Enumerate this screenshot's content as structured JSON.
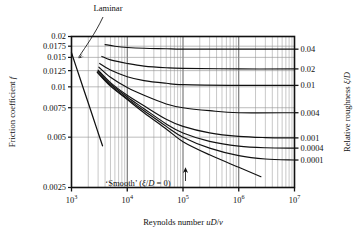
{
  "chart_data": {
    "type": "line",
    "title": "",
    "xlabel": "Reynolds number uD/ν",
    "ylabel": "Friction coefficient f",
    "ylabel_right": "Relative roughness ξ/D",
    "xscale": "log",
    "yscale": "log",
    "xlim": [
      1000,
      10000000
    ],
    "ylim": [
      0.0025,
      0.02
    ],
    "grid": true,
    "legend": "none",
    "xticks": [
      {
        "value": 1000,
        "label": "10³",
        "base": "10",
        "exp": "3"
      },
      {
        "value": 10000,
        "label": "10⁴",
        "base": "10",
        "exp": "4"
      },
      {
        "value": 100000,
        "label": "10⁵",
        "base": "10",
        "exp": "5"
      },
      {
        "value": 1000000,
        "label": "10⁶",
        "base": "10",
        "exp": "6"
      },
      {
        "value": 10000000,
        "label": "10⁷",
        "base": "10",
        "exp": "7"
      }
    ],
    "yticks": [
      {
        "value": 0.02,
        "label": "0.02"
      },
      {
        "value": 0.0175,
        "label": "0.0175"
      },
      {
        "value": 0.015,
        "label": "0.015"
      },
      {
        "value": 0.0125,
        "label": "0.0125"
      },
      {
        "value": 0.01,
        "label": "0.01"
      },
      {
        "value": 0.0075,
        "label": "0.0075"
      },
      {
        "value": 0.005,
        "label": "0.005"
      },
      {
        "value": 0.0025,
        "label": "0.0025"
      }
    ],
    "yticks_right": [
      {
        "value": 0.04,
        "label": "0.04",
        "f_asymptote": 0.0168
      },
      {
        "value": 0.02,
        "label": "0.02",
        "f_asymptote": 0.0128
      },
      {
        "value": 0.01,
        "label": "0.01",
        "f_asymptote": 0.0102
      },
      {
        "value": 0.004,
        "label": "0.004",
        "f_asymptote": 0.007
      },
      {
        "value": 0.001,
        "label": "0.001",
        "f_asymptote": 0.00495
      },
      {
        "value": 0.0004,
        "label": "0.0004",
        "f_asymptote": 0.0043
      },
      {
        "value": 0.0001,
        "label": "0.0001",
        "f_asymptote": 0.00365
      }
    ],
    "series": [
      {
        "name": "xi/D = 0.04",
        "roughness": 0.04,
        "points": [
          [
            4000,
            0.0179
          ],
          [
            6000,
            0.0175
          ],
          [
            10000,
            0.0172
          ],
          [
            20000,
            0.017
          ],
          [
            50000,
            0.0169
          ],
          [
            100000,
            0.0168
          ],
          [
            1000000,
            0.0168
          ],
          [
            10000000,
            0.0168
          ]
        ]
      },
      {
        "name": "xi/D = 0.02",
        "roughness": 0.02,
        "points": [
          [
            3500,
            0.0152
          ],
          [
            5000,
            0.0145
          ],
          [
            10000,
            0.0138
          ],
          [
            20000,
            0.0133
          ],
          [
            50000,
            0.013
          ],
          [
            100000,
            0.0129
          ],
          [
            1000000,
            0.0128
          ],
          [
            10000000,
            0.0128
          ]
        ]
      },
      {
        "name": "xi/D = 0.01",
        "roughness": 0.01,
        "points": [
          [
            3200,
            0.0138
          ],
          [
            5000,
            0.0126
          ],
          [
            10000,
            0.0115
          ],
          [
            20000,
            0.0109
          ],
          [
            50000,
            0.0105
          ],
          [
            100000,
            0.0103
          ],
          [
            1000000,
            0.0102
          ],
          [
            10000000,
            0.0102
          ]
        ]
      },
      {
        "name": "xi/D = 0.004",
        "roughness": 0.004,
        "points": [
          [
            3100,
            0.0131
          ],
          [
            5000,
            0.0114
          ],
          [
            10000,
            0.0099
          ],
          [
            20000,
            0.0089
          ],
          [
            50000,
            0.0079
          ],
          [
            100000,
            0.0075
          ],
          [
            300000,
            0.0072
          ],
          [
            1000000,
            0.007
          ],
          [
            10000000,
            0.007
          ]
        ]
      },
      {
        "name": "xi/D = 0.001",
        "roughness": 0.001,
        "points": [
          [
            3000,
            0.0126
          ],
          [
            5000,
            0.0106
          ],
          [
            10000,
            0.0089
          ],
          [
            20000,
            0.0077
          ],
          [
            50000,
            0.0064
          ],
          [
            100000,
            0.0058
          ],
          [
            300000,
            0.0053
          ],
          [
            1000000,
            0.00505
          ],
          [
            3000000,
            0.00497
          ],
          [
            10000000,
            0.00495
          ]
        ]
      },
      {
        "name": "xi/D = 0.0004",
        "roughness": 0.0004,
        "points": [
          [
            3000,
            0.0124
          ],
          [
            5000,
            0.0104
          ],
          [
            10000,
            0.0087
          ],
          [
            20000,
            0.0074
          ],
          [
            50000,
            0.006
          ],
          [
            100000,
            0.0053
          ],
          [
            300000,
            0.00472
          ],
          [
            1000000,
            0.00442
          ],
          [
            3000000,
            0.00432
          ],
          [
            10000000,
            0.0043
          ]
        ]
      },
      {
        "name": "xi/D = 0.0001",
        "roughness": 0.0001,
        "points": [
          [
            2900,
            0.0123
          ],
          [
            5000,
            0.0102
          ],
          [
            10000,
            0.0085
          ],
          [
            20000,
            0.0072
          ],
          [
            50000,
            0.0058
          ],
          [
            100000,
            0.005
          ],
          [
            300000,
            0.0043
          ],
          [
            1000000,
            0.00388
          ],
          [
            3000000,
            0.0037
          ],
          [
            10000000,
            0.00365
          ]
        ]
      },
      {
        "name": "Smooth",
        "roughness": 0,
        "points": [
          [
            2900,
            0.0122
          ],
          [
            5000,
            0.0101
          ],
          [
            10000,
            0.0084
          ],
          [
            20000,
            0.007
          ],
          [
            50000,
            0.0056
          ],
          [
            100000,
            0.0047
          ],
          [
            300000,
            0.00392
          ],
          [
            1000000,
            0.0033
          ],
          [
            2500000,
            0.0029
          ]
        ]
      },
      {
        "name": "Laminar",
        "roughness": null,
        "laminar": true,
        "points": [
          [
            1000,
            0.016
          ],
          [
            1400,
            0.0114
          ],
          [
            2000,
            0.008
          ],
          [
            2800,
            0.0057
          ],
          [
            3600,
            0.00444
          ]
        ]
      }
    ],
    "annotations": [
      {
        "name": "laminar-label",
        "text": "Laminar",
        "x": 108,
        "y": 11
      },
      {
        "name": "smooth-label",
        "text": "‘Smooth’ (ξ/D = 0)",
        "x": 138,
        "y": 186
      }
    ]
  },
  "annotation_parts": {
    "smooth_quote_open": "‘Smooth’ (",
    "smooth_xi": "ξ",
    "smooth_slash": "/",
    "smooth_D": "D",
    "smooth_eq": " = 0)",
    "laminar": "Laminar"
  },
  "axis_titles": {
    "y_left_main": "Friction coefficient ",
    "y_left_sym": "f",
    "y_right_main": "Relative roughness ",
    "y_right_sym1": "ξ",
    "y_right_slash": "/",
    "y_right_sym2": "D",
    "x_main": "Reynolds number ",
    "x_sym_u": "u",
    "x_sym_D": "D",
    "x_slash": "/",
    "x_sym_nu": "ν"
  }
}
